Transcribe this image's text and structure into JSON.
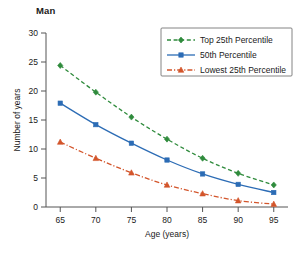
{
  "chart_data": {
    "type": "line",
    "title": "Man",
    "xlabel": "Age (years)",
    "ylabel": "Number of years",
    "x": [
      65,
      70,
      75,
      80,
      85,
      90,
      95
    ],
    "xlim": [
      63,
      97
    ],
    "ylim": [
      0,
      30
    ],
    "xticks": [
      "65",
      "70",
      "75",
      "80",
      "85",
      "90",
      "95"
    ],
    "yticks": [
      "0",
      "5",
      "10",
      "15",
      "20",
      "25",
      "30"
    ],
    "grid": false,
    "legend_position": "top-right",
    "series": [
      {
        "name": "Top 25th Percentile",
        "color": "#2f8b3c",
        "linestyle": "dashed",
        "marker": "diamond",
        "values": [
          24.4,
          19.8,
          15.5,
          11.7,
          8.4,
          5.8,
          3.8
        ]
      },
      {
        "name": "50th Percentile",
        "color": "#2c6cb5",
        "linestyle": "solid",
        "marker": "square",
        "values": [
          17.9,
          14.2,
          11.0,
          8.1,
          5.7,
          3.9,
          2.5
        ]
      },
      {
        "name": "Lowest 25th Percentile",
        "color": "#d3552b",
        "linestyle": "dashdot",
        "marker": "triangle",
        "values": [
          11.2,
          8.4,
          5.9,
          3.8,
          2.3,
          1.1,
          0.5
        ]
      }
    ]
  },
  "axis": {
    "x_title": "Age (years)",
    "y_title": "Number of years"
  },
  "legend": {
    "items": [
      {
        "label": "Top 25th Percentile"
      },
      {
        "label": "50th Percentile"
      },
      {
        "label": "Lowest 25th Percentile"
      }
    ]
  }
}
